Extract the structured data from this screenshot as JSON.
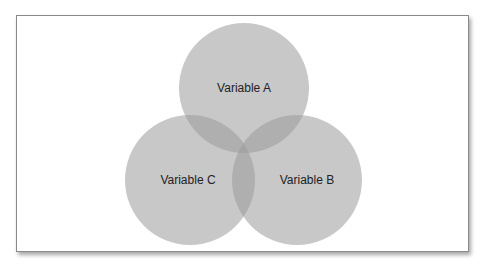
{
  "diagram": {
    "type": "venn",
    "sets": [
      {
        "id": "A",
        "label": "Variable A",
        "cx": 244,
        "cy": 88,
        "r": 65,
        "label_x": 244,
        "label_y": 92
      },
      {
        "id": "B",
        "label": "Variable B",
        "cx": 297,
        "cy": 180,
        "r": 65,
        "label_x": 307,
        "label_y": 184
      },
      {
        "id": "C",
        "label": "Variable C",
        "cx": 190,
        "cy": 180,
        "r": 65,
        "label_x": 188,
        "label_y": 184
      }
    ],
    "colors": {
      "circle_fill": "#9a9a9a",
      "circle_opacity": 0.55,
      "frame_border": "#8a8a8a",
      "text": "#222222"
    }
  }
}
